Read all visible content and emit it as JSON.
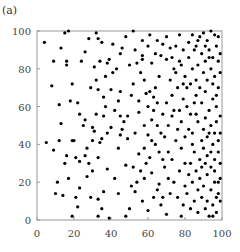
{
  "panel_label": "(a)",
  "chart_data": {
    "type": "scatter",
    "title": "",
    "xlabel": "",
    "ylabel": "",
    "xlim": [
      0,
      100
    ],
    "ylim": [
      0,
      100
    ],
    "xticks": [
      0,
      20,
      40,
      60,
      80,
      100
    ],
    "yticks": [
      0,
      20,
      40,
      60,
      80,
      100
    ],
    "grid": false,
    "legend": null,
    "marker_color": "#000000",
    "frame_color": "#999999",
    "series": [
      {
        "name": "points",
        "points": [
          [
            4,
            94
          ],
          [
            17,
            100
          ],
          [
            9,
            84
          ],
          [
            16,
            84
          ],
          [
            16,
            82
          ],
          [
            24,
            84
          ],
          [
            8,
            71
          ],
          [
            19,
            72
          ],
          [
            13,
            91
          ],
          [
            15,
            99
          ],
          [
            12,
            61
          ],
          [
            18,
            63
          ],
          [
            22,
            62
          ],
          [
            23,
            56
          ],
          [
            26,
            53
          ],
          [
            35,
            43
          ],
          [
            13,
            51
          ],
          [
            5,
            41
          ],
          [
            12,
            42
          ],
          [
            19,
            42
          ],
          [
            20,
            42
          ],
          [
            9,
            37
          ],
          [
            16,
            34
          ],
          [
            21,
            33
          ],
          [
            26,
            34
          ],
          [
            33,
            33
          ],
          [
            15,
            30
          ],
          [
            23,
            31
          ],
          [
            28,
            30
          ],
          [
            17,
            22
          ],
          [
            27,
            23
          ],
          [
            11,
            20
          ],
          [
            10,
            14
          ],
          [
            14,
            13
          ],
          [
            21,
            12
          ],
          [
            29,
            12
          ],
          [
            23,
            17
          ],
          [
            33,
            11
          ],
          [
            19,
            2
          ],
          [
            35,
            6
          ],
          [
            33,
            2
          ],
          [
            39,
            1
          ],
          [
            22,
            7
          ],
          [
            36,
            15
          ],
          [
            44,
            14
          ],
          [
            30,
            26
          ],
          [
            38,
            27
          ],
          [
            42,
            22
          ],
          [
            48,
            29
          ],
          [
            34,
            41
          ],
          [
            38,
            46
          ],
          [
            30,
            49
          ],
          [
            31,
            47
          ],
          [
            40,
            49
          ],
          [
            45,
            45
          ],
          [
            46,
            48
          ],
          [
            44,
            38
          ],
          [
            27,
            38
          ],
          [
            30,
            42
          ],
          [
            49,
            43
          ],
          [
            29,
            70
          ],
          [
            33,
            69
          ],
          [
            37,
            60
          ],
          [
            40,
            69
          ],
          [
            36,
            65
          ],
          [
            32,
            56
          ],
          [
            36,
            55
          ],
          [
            42,
            58
          ],
          [
            44,
            63
          ],
          [
            45,
            68
          ],
          [
            41,
            78
          ],
          [
            37,
            76
          ],
          [
            32,
            74
          ],
          [
            31,
            81
          ],
          [
            34,
            84
          ],
          [
            38,
            83
          ],
          [
            39,
            85
          ],
          [
            43,
            80
          ],
          [
            45,
            88
          ],
          [
            41,
            93
          ],
          [
            26,
            89
          ],
          [
            28,
            96
          ],
          [
            33,
            96
          ],
          [
            32,
            99
          ],
          [
            35,
            94
          ],
          [
            46,
            91
          ],
          [
            48,
            97
          ],
          [
            52,
            100
          ],
          [
            53,
            90
          ],
          [
            57,
            95
          ],
          [
            50,
            82
          ],
          [
            54,
            83
          ],
          [
            57,
            85
          ],
          [
            56,
            78
          ],
          [
            58,
            74
          ],
          [
            52,
            72
          ],
          [
            51,
            66
          ],
          [
            55,
            63
          ],
          [
            59,
            67
          ],
          [
            61,
            68
          ],
          [
            49,
            55
          ],
          [
            55,
            57
          ],
          [
            58,
            50
          ],
          [
            53,
            46
          ],
          [
            60,
            45
          ],
          [
            62,
            53
          ],
          [
            63,
            58
          ],
          [
            65,
            62
          ],
          [
            64,
            70
          ],
          [
            66,
            76
          ],
          [
            62,
            83
          ],
          [
            64,
            88
          ],
          [
            67,
            87
          ],
          [
            68,
            93
          ],
          [
            70,
            97
          ],
          [
            72,
            91
          ],
          [
            61,
            98
          ],
          [
            73,
            86
          ],
          [
            75,
            92
          ],
          [
            77,
            98
          ],
          [
            55,
            35
          ],
          [
            58,
            38
          ],
          [
            61,
            33
          ],
          [
            64,
            40
          ],
          [
            66,
            36
          ],
          [
            52,
            28
          ],
          [
            58,
            22
          ],
          [
            62,
            25
          ],
          [
            66,
            19
          ],
          [
            69,
            28
          ],
          [
            53,
            15
          ],
          [
            57,
            10
          ],
          [
            60,
            5
          ],
          [
            63,
            12
          ],
          [
            67,
            8
          ],
          [
            70,
            3
          ],
          [
            72,
            14
          ],
          [
            74,
            20
          ],
          [
            50,
            6
          ],
          [
            48,
            2
          ],
          [
            69,
            44
          ],
          [
            71,
            50
          ],
          [
            73,
            55
          ],
          [
            76,
            48
          ],
          [
            78,
            52
          ],
          [
            75,
            42
          ],
          [
            78,
            38
          ],
          [
            80,
            44
          ],
          [
            82,
            48
          ],
          [
            84,
            40
          ],
          [
            70,
            62
          ],
          [
            73,
            66
          ],
          [
            76,
            70
          ],
          [
            79,
            64
          ],
          [
            81,
            60
          ],
          [
            83,
            56
          ],
          [
            85,
            62
          ],
          [
            72,
            74
          ],
          [
            75,
            78
          ],
          [
            78,
            82
          ],
          [
            80,
            76
          ],
          [
            82,
            86
          ],
          [
            84,
            80
          ],
          [
            86,
            74
          ],
          [
            88,
            70
          ],
          [
            79,
            90
          ],
          [
            82,
            94
          ],
          [
            84,
            98
          ],
          [
            86,
            92
          ],
          [
            88,
            97
          ],
          [
            90,
            99
          ],
          [
            92,
            95
          ],
          [
            94,
            100
          ],
          [
            96,
            98
          ],
          [
            98,
            97
          ],
          [
            89,
            88
          ],
          [
            91,
            84
          ],
          [
            93,
            90
          ],
          [
            95,
            86
          ],
          [
            97,
            92
          ],
          [
            99,
            88
          ],
          [
            87,
            82
          ],
          [
            90,
            78
          ],
          [
            92,
            74
          ],
          [
            94,
            80
          ],
          [
            96,
            76
          ],
          [
            98,
            70
          ],
          [
            86,
            66
          ],
          [
            89,
            62
          ],
          [
            91,
            68
          ],
          [
            93,
            58
          ],
          [
            95,
            64
          ],
          [
            97,
            60
          ],
          [
            99,
            55
          ],
          [
            87,
            52
          ],
          [
            90,
            48
          ],
          [
            92,
            44
          ],
          [
            94,
            50
          ],
          [
            96,
            46
          ],
          [
            98,
            42
          ],
          [
            85,
            36
          ],
          [
            88,
            32
          ],
          [
            90,
            38
          ],
          [
            92,
            34
          ],
          [
            94,
            28
          ],
          [
            96,
            32
          ],
          [
            98,
            36
          ],
          [
            99,
            30
          ],
          [
            80,
            30
          ],
          [
            77,
            26
          ],
          [
            82,
            24
          ],
          [
            84,
            20
          ],
          [
            86,
            26
          ],
          [
            88,
            22
          ],
          [
            90,
            18
          ],
          [
            92,
            24
          ],
          [
            94,
            16
          ],
          [
            96,
            20
          ],
          [
            98,
            14
          ],
          [
            99,
            22
          ],
          [
            76,
            12
          ],
          [
            79,
            8
          ],
          [
            81,
            14
          ],
          [
            83,
            6
          ],
          [
            85,
            10
          ],
          [
            87,
            4
          ],
          [
            89,
            12
          ],
          [
            91,
            6
          ],
          [
            93,
            2
          ],
          [
            95,
            8
          ],
          [
            97,
            4
          ],
          [
            99,
            10
          ],
          [
            78,
            2
          ],
          [
            80,
            18
          ],
          [
            73,
            32
          ],
          [
            71,
            36
          ],
          [
            68,
            32
          ],
          [
            67,
            46
          ],
          [
            74,
            58
          ],
          [
            77,
            58
          ],
          [
            60,
            60
          ],
          [
            63,
            65
          ],
          [
            47,
            52
          ],
          [
            45,
            55
          ],
          [
            25,
            50
          ],
          [
            57,
            87
          ],
          [
            60,
            92
          ],
          [
            65,
            95
          ],
          [
            70,
            85
          ],
          [
            74,
            80
          ],
          [
            81,
            70
          ],
          [
            83,
            72
          ],
          [
            85,
            90
          ],
          [
            87,
            95
          ],
          [
            91,
            92
          ],
          [
            93,
            86
          ],
          [
            95,
            72
          ],
          [
            97,
            66
          ],
          [
            99,
            78
          ],
          [
            98,
            84
          ],
          [
            89,
            42
          ],
          [
            91,
            54
          ],
          [
            93,
            46
          ],
          [
            95,
            40
          ],
          [
            97,
            52
          ],
          [
            99,
            46
          ],
          [
            84,
            46
          ],
          [
            86,
            56
          ],
          [
            79,
            72
          ],
          [
            77,
            84
          ],
          [
            68,
            56
          ],
          [
            65,
            50
          ],
          [
            62,
            42
          ],
          [
            59,
            30
          ],
          [
            56,
            26
          ],
          [
            54,
            20
          ],
          [
            51,
            18
          ],
          [
            65,
            16
          ],
          [
            68,
            12
          ],
          [
            71,
            22
          ],
          [
            83,
            30
          ],
          [
            87,
            16
          ],
          [
            89,
            28
          ],
          [
            91,
            30
          ],
          [
            94,
            36
          ],
          [
            96,
            26
          ],
          [
            98,
            20
          ],
          [
            97,
            12
          ],
          [
            95,
            2
          ],
          [
            92,
            10
          ]
        ]
      }
    ]
  }
}
